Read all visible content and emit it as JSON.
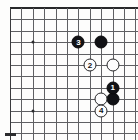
{
  "diagram": {
    "type": "go-board-diagram",
    "board": {
      "left_edge_visible": true,
      "top_edge_visible": true,
      "right_edge_visible": false,
      "bottom_edge_visible": false,
      "grid_spacing_px": 11.4,
      "origin_x_px": 10,
      "origin_y_px": 8,
      "columns_visible": 12,
      "rows_visible": 12,
      "star_points": [
        {
          "col": 2,
          "row": 3
        },
        {
          "col": 2,
          "row": 9
        }
      ]
    },
    "stones": [
      {
        "id": "stone-black-corner",
        "color": "black",
        "label": "",
        "col": 8,
        "row": 3
      },
      {
        "id": "stone-move-3",
        "color": "black",
        "label": "3",
        "col": 6,
        "row": 3
      },
      {
        "id": "stone-move-2",
        "color": "white",
        "label": "2",
        "col": 7,
        "row": 5
      },
      {
        "id": "stone-white-right",
        "color": "white",
        "label": "",
        "col": 9,
        "row": 5
      },
      {
        "id": "stone-move-1",
        "color": "black",
        "label": "1",
        "col": 9,
        "row": 7
      },
      {
        "id": "stone-black-lower",
        "color": "black",
        "label": "",
        "col": 9,
        "row": 8
      },
      {
        "id": "stone-white-lower",
        "color": "white",
        "label": "",
        "col": 8,
        "row": 8
      },
      {
        "id": "stone-move-4",
        "color": "white",
        "label": "4",
        "col": 8,
        "row": 9
      }
    ],
    "move_labels": [
      "1",
      "2",
      "3",
      "4"
    ],
    "colors": {
      "black_stone": "#111215",
      "white_stone": "#fdfdfd",
      "grid_line": "#5f6063",
      "board_edge": "#27282a",
      "background": "#fdfdfc"
    }
  }
}
